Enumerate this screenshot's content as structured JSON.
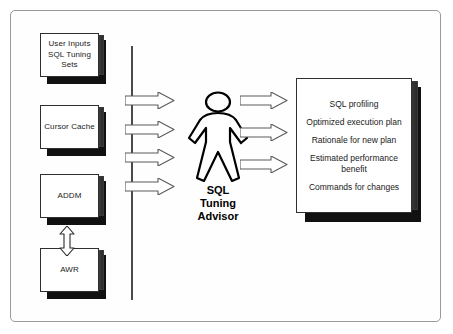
{
  "diagram": {
    "frame_color": "#9a9a9a",
    "background": "#ffffff",
    "ink_color": "#1a1a1a"
  },
  "sources": [
    {
      "id": "user-inputs",
      "label": "User Inputs\nSQL Tuning\nSets"
    },
    {
      "id": "cursor-cache",
      "label": "Cursor Cache"
    },
    {
      "id": "addm",
      "label": "ADDM"
    },
    {
      "id": "awr",
      "label": "AWR"
    }
  ],
  "advisor": {
    "label": "SQL\nTuning\nAdvisor",
    "icon": "person-figure-icon"
  },
  "input_arrows": [
    {
      "id": "input-arrow-1"
    },
    {
      "id": "input-arrow-2"
    },
    {
      "id": "input-arrow-3"
    },
    {
      "id": "input-arrow-4"
    }
  ],
  "output_arrows": [
    {
      "id": "output-arrow-1"
    },
    {
      "id": "output-arrow-2"
    },
    {
      "id": "output-arrow-3"
    }
  ],
  "outputs": {
    "items": [
      {
        "id": "sql-profiling",
        "label": "SQL profiling"
      },
      {
        "id": "optimized-execution-plan",
        "label": "Optimized execution plan"
      },
      {
        "id": "rationale-for-new-plan",
        "label": "Rationale for new plan"
      },
      {
        "id": "estimated-performance-benefit",
        "label": "Estimated performance\nbenefit"
      },
      {
        "id": "commands-for-changes",
        "label": "Commands for changes"
      }
    ]
  },
  "connectors": {
    "addm_awr": {
      "id": "addm-awr-bidirectional-arrow",
      "type": "double-headed-vertical"
    }
  }
}
